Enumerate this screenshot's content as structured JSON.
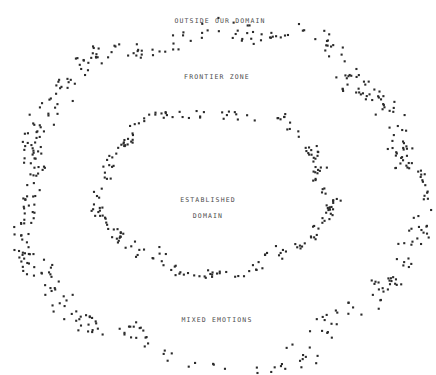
{
  "canvas": {
    "width": 436,
    "height": 375,
    "background": "#ffffff",
    "dot_color": "#2b2b2b",
    "dot_size": 2.1,
    "label_color": "#4a4a4a"
  },
  "labels": {
    "outer_top": "OUTSIDE OUR DOMAIN",
    "frontier": "FRONTIER ZONE",
    "center_line1": "ESTABLISHED",
    "center_line2": "DOMAIN",
    "bottom": "MIXED EMOTIONS"
  },
  "chart_data": {
    "type": "scatter",
    "title": "",
    "xlabel": "",
    "ylabel": "",
    "xlim": [
      0,
      436
    ],
    "ylim": [
      0,
      375
    ],
    "grid": false,
    "legend": "none",
    "annotations": [
      {
        "text": "OUTSIDE OUR DOMAIN",
        "x": 220,
        "y": 20
      },
      {
        "text": "FRONTIER ZONE",
        "x": 217,
        "y": 76
      },
      {
        "text": "ESTABLISHED",
        "x": 208,
        "y": 199
      },
      {
        "text": "DOMAIN",
        "x": 208,
        "y": 215
      },
      {
        "text": "MIXED EMOTIONS",
        "x": 217,
        "y": 319
      }
    ],
    "series": [
      {
        "name": "outer-ring",
        "shape": "ellipse-band",
        "center": [
          220,
          196
        ],
        "radius_x": 198,
        "radius_y": 166,
        "band_thickness": 30,
        "point_count": 430,
        "density_profile": "flank-heavy",
        "seed": 20413
      },
      {
        "name": "inner-ring",
        "shape": "ellipse-band",
        "center": [
          215,
          192
        ],
        "radius_x": 114,
        "radius_y": 82,
        "band_thickness": 16,
        "point_count": 215,
        "density_profile": "flank-heavy",
        "seed": 77112
      }
    ]
  }
}
